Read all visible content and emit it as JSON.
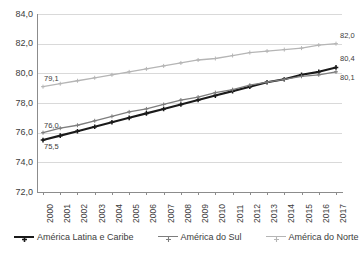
{
  "chart_data": {
    "type": "line",
    "title": "",
    "subtitle": "",
    "xlabel": "",
    "ylabel": "",
    "ylim": [
      72.0,
      84.0
    ],
    "yticks": [
      "72,0",
      "74,0",
      "76,0",
      "78,0",
      "80,0",
      "82,0",
      "84,0"
    ],
    "ytick_values": [
      72.0,
      74.0,
      76.0,
      78.0,
      80.0,
      82.0,
      84.0
    ],
    "grid": "horizontal",
    "legend_position": "bottom",
    "decimal_separator": ",",
    "categories": [
      "2000",
      "2001",
      "2002",
      "2003",
      "2004",
      "2005",
      "2006",
      "2007",
      "2008",
      "2009",
      "2010",
      "2011",
      "2012",
      "2013",
      "2014",
      "2015",
      "2016",
      "2017"
    ],
    "series": [
      {
        "name": "América Latina e Caribe",
        "color": "#1a1a1a",
        "marker": "plus",
        "width": 2.1,
        "values": [
          75.5,
          75.8,
          76.1,
          76.4,
          76.7,
          77.0,
          77.3,
          77.6,
          77.9,
          78.2,
          78.5,
          78.8,
          79.1,
          79.4,
          79.6,
          79.9,
          80.1,
          80.4
        ],
        "start_label": "75,5",
        "end_label": "80,4"
      },
      {
        "name": "América do Sul",
        "color": "#7d7d7d",
        "marker": "plus",
        "width": 1.3,
        "values": [
          76.0,
          76.3,
          76.5,
          76.8,
          77.1,
          77.4,
          77.6,
          77.9,
          78.2,
          78.4,
          78.7,
          78.9,
          79.2,
          79.4,
          79.6,
          79.8,
          79.9,
          80.1
        ],
        "start_label": "76,0",
        "end_label": "80,1"
      },
      {
        "name": "América do Norte",
        "color": "#b5b5b5",
        "marker": "plus",
        "width": 1.3,
        "values": [
          79.1,
          79.3,
          79.5,
          79.7,
          79.9,
          80.1,
          80.3,
          80.5,
          80.7,
          80.9,
          81.0,
          81.2,
          81.4,
          81.5,
          81.6,
          81.7,
          81.9,
          82.0
        ],
        "start_label": "79,1",
        "end_label": "82,0"
      }
    ]
  },
  "legend": {
    "items": [
      {
        "label": "América Latina e Caribe"
      },
      {
        "label": "América do Sul"
      },
      {
        "label": "América do Norte"
      }
    ]
  }
}
